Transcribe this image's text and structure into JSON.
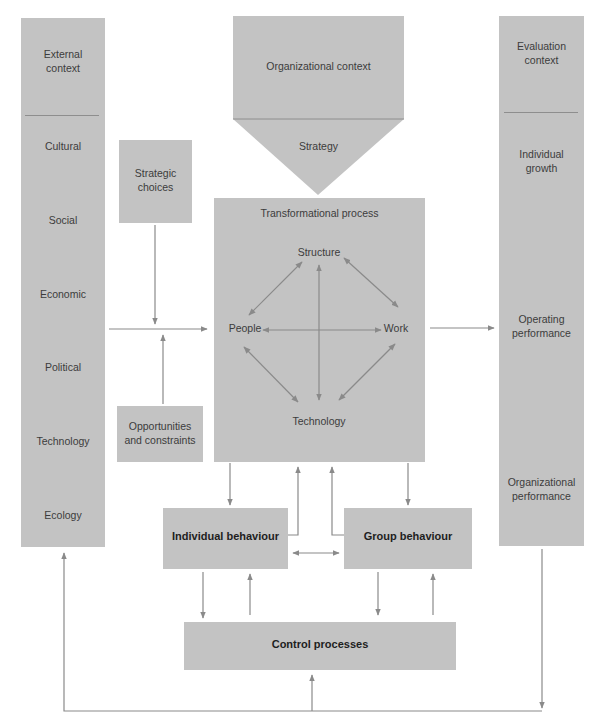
{
  "diagram": {
    "external_context": {
      "title": "External context",
      "title_lines": [
        "External",
        "context"
      ],
      "items": [
        "Cultural",
        "Social",
        "Economic",
        "Political",
        "Technology",
        "Ecology"
      ]
    },
    "organizational_context": {
      "title": "Organizational context",
      "strategy": "Strategy"
    },
    "evaluation_context": {
      "title": "Evaluation context",
      "title_lines": [
        "Evaluation",
        "context"
      ],
      "items": [
        {
          "lines": [
            "Individual",
            "growth"
          ]
        },
        {
          "lines": [
            "Operating",
            "performance"
          ]
        },
        {
          "lines": [
            "Organizational",
            "performance"
          ]
        }
      ]
    },
    "strategic_choices": {
      "lines": [
        "Strategic",
        "choices"
      ]
    },
    "opportunities_constraints": {
      "lines": [
        "Opportunities",
        "and constraints"
      ]
    },
    "transformational_process": {
      "title": "Transformational process",
      "nodes": {
        "top": "Structure",
        "left": "People",
        "right": "Work",
        "bottom": "Technology"
      }
    },
    "individual_behaviour": "Individual behaviour",
    "group_behaviour": "Group behaviour",
    "control_processes": "Control processes"
  },
  "colors": {
    "box_fill": "#c3c3c3",
    "arrow": "#8a8a8a",
    "text": "#3c3c3c",
    "divider": "#8e8e8e"
  }
}
